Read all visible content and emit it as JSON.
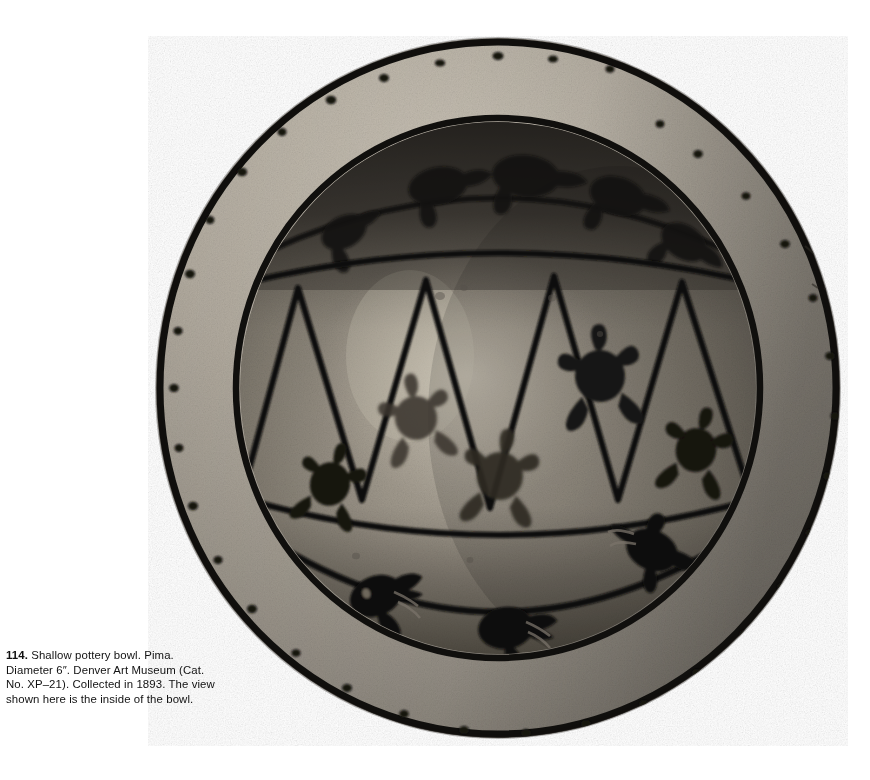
{
  "plate": {
    "number": "114.",
    "caption_text": " Shallow pottery bowl. Pima. Diameter 6″. Denver Art Museum (Cat. No. XP–21). Collected in 1893. The view shown here is the inside of the bowl.",
    "full_caption": "114. Shallow pottery bowl. Pima. Diameter 6″. Denver Art Museum (Cat. No. XP–21). Collected in 1893. The view shown here is the inside of the bowl.",
    "object_type": "Shallow pottery bowl",
    "culture": "Pima",
    "diameter": "6″",
    "collection": "Denver Art Museum",
    "catalog_number": "Cat. No. XP–21",
    "collected_year": "1893",
    "view_note": "The view shown here is the inside of the bowl."
  },
  "photo": {
    "alt": "Black and white photograph of a shallow Pima pottery bowl seen from above, showing painted interior decoration",
    "page_background": "#ffffff",
    "palette": {
      "paint_black": "#141210",
      "rim_light": "#b9b2a6",
      "rim_mid": "#9c958a",
      "wall_mid": "#8e887c",
      "wall_dark": "#6a655c",
      "interior_shadow": "#3b3833",
      "interior_light": "#a8a295",
      "outline": "#0d0c0b"
    },
    "geometry": {
      "center_x": 350,
      "center_y": 352,
      "rim_outer_rx": 342,
      "rim_outer_ry": 350,
      "rim_inner_rx": 278,
      "rim_inner_ry": 286,
      "interior_rx": 258,
      "interior_ry": 266
    },
    "decoration": {
      "rim_dot_count": 34,
      "rim_dot_note": "irregular small dark dots spaced around the light rim band",
      "band_upper_label": "upper band with dark bird figures in shadow",
      "band_middle_label": "zigzag band of triangles containing turtle figures",
      "band_lower_label": "lower band with bird figures",
      "triangle_count": 7,
      "turtle_count": 6,
      "bird_count": 6,
      "turtles": [
        {
          "cx": 204,
          "cy": 470,
          "r": 25,
          "rot": 20,
          "fill": "#17150f",
          "faded": false
        },
        {
          "cx": 278,
          "cy": 392,
          "r": 27,
          "rot": -15,
          "fill": "#3c382f",
          "faded": true
        },
        {
          "cx": 360,
          "cy": 450,
          "r": 28,
          "rot": 8,
          "fill": "#34302a",
          "faded": true
        },
        {
          "cx": 452,
          "cy": 360,
          "r": 29,
          "rot": -8,
          "fill": "#1a1813",
          "faded": false
        },
        {
          "cx": 552,
          "cy": 418,
          "r": 25,
          "rot": 14,
          "fill": "#141210",
          "faded": false
        }
      ]
    }
  }
}
